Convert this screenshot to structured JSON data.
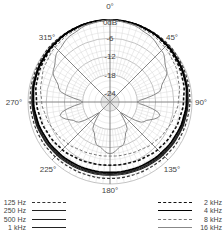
{
  "chart_data": {
    "type": "polar",
    "title": "",
    "radial_unit": "dB",
    "radial_ticks": [
      "0dB",
      "-6",
      "-12",
      "-18",
      "-24"
    ],
    "radial_range": [
      -27,
      0
    ],
    "angle_ticks": [
      "0°",
      "45°",
      "90°",
      "135°",
      "180°",
      "225°",
      "270°",
      "315°"
    ],
    "grid": true,
    "legend_position": "bottom",
    "angles_deg": [
      0,
      15,
      30,
      45,
      60,
      75,
      90,
      105,
      120,
      135,
      150,
      165,
      180,
      195,
      210,
      225,
      240,
      255,
      270,
      285,
      300,
      315,
      330,
      345
    ],
    "series": [
      {
        "name": "125 Hz",
        "style": "dashed",
        "color": "#333333",
        "width": 1.2,
        "values": [
          0,
          0,
          0,
          0,
          -0.3,
          -0.5,
          -0.7,
          -1.0,
          -1.2,
          -1.5,
          -1.7,
          -1.8,
          -1.8,
          -1.8,
          -1.7,
          -1.5,
          -1.2,
          -1.0,
          -0.7,
          -0.5,
          -0.3,
          0,
          0,
          0
        ]
      },
      {
        "name": "250 Hz",
        "style": "solid",
        "color": "#222222",
        "width": 1.2,
        "values": [
          0,
          0,
          -0.2,
          -0.4,
          -0.7,
          -1.0,
          -1.3,
          -1.6,
          -2.0,
          -2.3,
          -2.6,
          -2.8,
          -2.9,
          -2.8,
          -2.6,
          -2.3,
          -2.0,
          -1.6,
          -1.3,
          -1.0,
          -0.7,
          -0.4,
          -0.2,
          0
        ]
      },
      {
        "name": "500 Hz",
        "style": "solid",
        "color": "#222222",
        "width": 1.2,
        "values": [
          0,
          0,
          -0.2,
          -0.5,
          -0.8,
          -1.1,
          -1.4,
          -1.8,
          -2.2,
          -2.6,
          -2.9,
          -3.1,
          -3.2,
          -3.1,
          -2.9,
          -2.6,
          -2.2,
          -1.8,
          -1.4,
          -1.1,
          -0.8,
          -0.5,
          -0.2,
          0
        ]
      },
      {
        "name": "1 kHz",
        "style": "solid",
        "color": "#222222",
        "width": 1.0,
        "values": [
          0,
          0,
          -0.3,
          -0.6,
          -0.9,
          -1.2,
          -1.6,
          -2.0,
          -2.4,
          -2.8,
          -3.1,
          -3.3,
          -3.4,
          -3.3,
          -3.1,
          -2.8,
          -2.4,
          -2.0,
          -1.6,
          -1.2,
          -0.9,
          -0.6,
          -0.3,
          0
        ]
      },
      {
        "name": "2 kHz",
        "style": "dashed",
        "color": "#111111",
        "width": 1.6,
        "values": [
          0,
          0,
          -0.3,
          -0.8,
          -1.4,
          -2.0,
          -2.8,
          -3.5,
          -4.2,
          -4.8,
          -5.5,
          -6.0,
          -6.2,
          -6.0,
          -5.5,
          -4.8,
          -4.2,
          -3.5,
          -2.8,
          -2.0,
          -1.4,
          -0.8,
          -0.3,
          0
        ]
      },
      {
        "name": "4 kHz",
        "style": "solid",
        "color": "#000000",
        "width": 1.8,
        "values": [
          0,
          0,
          -0.2,
          -0.5,
          -0.9,
          -1.3,
          -1.8,
          -2.3,
          -2.8,
          -3.2,
          -3.5,
          -3.7,
          -3.8,
          -3.7,
          -3.5,
          -3.2,
          -2.8,
          -2.3,
          -1.8,
          -1.3,
          -0.9,
          -0.5,
          -0.2,
          0
        ]
      },
      {
        "name": "8 kHz",
        "style": "dashed",
        "color": "#777777",
        "width": 1.0,
        "values": [
          0,
          -0.3,
          -0.8,
          -1.5,
          -2.4,
          -3.5,
          -4.5,
          -5.5,
          -6.5,
          -7.5,
          -8.5,
          -9.0,
          -9.2,
          -9.0,
          -8.5,
          -7.5,
          -6.5,
          -5.5,
          -4.5,
          -3.5,
          -2.4,
          -1.5,
          -0.8,
          -0.3
        ]
      },
      {
        "name": "16 kHz",
        "style": "solid",
        "color": "#888888",
        "width": 1.0,
        "values": [
          0,
          -0.5,
          -1.5,
          -3.0,
          -5.5,
          -9.5,
          -18.0,
          -10.0,
          -14.0,
          -22.0,
          -16.0,
          -12.0,
          -10.0,
          -12.0,
          -16.0,
          -22.0,
          -14.0,
          -10.0,
          -18.0,
          -9.5,
          -5.5,
          -3.0,
          -1.5,
          -0.5
        ]
      }
    ]
  },
  "legend": {
    "left": [
      {
        "label": "125 Hz",
        "style": "dashed",
        "color": "#333333"
      },
      {
        "label": "250 Hz",
        "style": "solid",
        "color": "#222222"
      },
      {
        "label": "500 Hz",
        "style": "solid",
        "color": "#222222"
      },
      {
        "label": "1 kHz",
        "style": "solid",
        "color": "#222222"
      }
    ],
    "right": [
      {
        "label": "2 kHz",
        "style": "dashed",
        "color": "#111111"
      },
      {
        "label": "4 kHz",
        "style": "solid",
        "color": "#000000"
      },
      {
        "label": "8 kHz",
        "style": "dashed",
        "color": "#777777"
      },
      {
        "label": "16 kHz",
        "style": "solid",
        "color": "#888888"
      }
    ]
  }
}
